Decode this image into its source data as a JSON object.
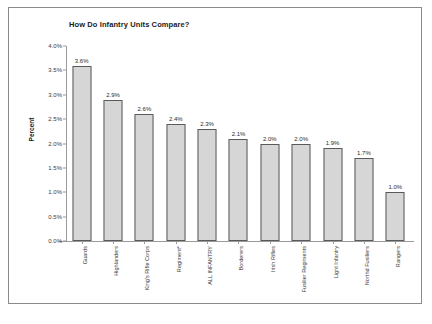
{
  "chart_data": {
    "type": "bar",
    "title": "How Do Infantry Units Compare?",
    "xlabel": "",
    "ylabel": "Percent",
    "ylim": [
      0,
      4.0
    ],
    "ytick_labels": [
      "0.0%",
      "0.5%",
      "1.0%",
      "1.5%",
      "2.0%",
      "2.5%",
      "3.0%",
      "3.5%",
      "4.0%"
    ],
    "ytick_values": [
      0,
      0.5,
      1.0,
      1.5,
      2.0,
      2.5,
      3.0,
      3.5,
      4.0
    ],
    "grid": false,
    "legend": "none",
    "categories": [
      "Guards",
      "Highlanders",
      "King's Rifle Corps",
      "Regiment*",
      "ALL INFANTRY",
      "Borderers",
      "Irish Rifles",
      "Fusilier Regiments",
      "Light Infantry",
      "Northd Fusiliers",
      "Rangers"
    ],
    "values": [
      3.6,
      2.9,
      2.6,
      2.4,
      2.3,
      2.1,
      2.0,
      2.0,
      1.9,
      1.7,
      1.0
    ],
    "data_labels": [
      "3.6%",
      "2.9%",
      "2.6%",
      "2.4%",
      "2.3%",
      "2.1%",
      "2.0%",
      "2.0%",
      "1.9%",
      "1.7%",
      "1.0%"
    ]
  },
  "style": {
    "bar_fill": "#d6d6d6",
    "bar_border": "#5a5a5a",
    "axis_color": "#9a9a9a",
    "frame_color": "#8a8a8a",
    "text_color": "#1a1a1a",
    "plot_background": "#ffffff"
  }
}
